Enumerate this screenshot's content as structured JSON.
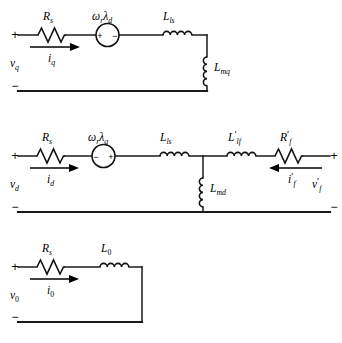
{
  "figure": {
    "type": "circuit-diagram",
    "ink_color": "#111111",
    "background_color": "#ffffff",
    "width": 342,
    "height": 343
  },
  "circuits": [
    {
      "id": "q-axis",
      "name": "q-axis equivalent circuit",
      "terminal": {
        "plus": "+",
        "minus": "−",
        "voltage_base": "v",
        "voltage_sub": "q"
      },
      "current": {
        "base": "i",
        "sub": "q"
      },
      "elements": [
        {
          "kind": "resistor",
          "base": "R",
          "sub": "s",
          "prime": ""
        },
        {
          "kind": "source",
          "base": "ω",
          "sub": "r",
          "base2": "λ",
          "sub2": "d",
          "polarity_left": "+",
          "polarity_right": "−"
        },
        {
          "kind": "inductor",
          "base": "L",
          "sub": "ls",
          "prime": ""
        },
        {
          "kind": "shunt-inductor",
          "base": "L",
          "sub": "mq",
          "prime": ""
        }
      ]
    },
    {
      "id": "d-axis",
      "name": "d-axis equivalent circuit",
      "terminal": {
        "plus": "+",
        "minus": "−",
        "voltage_base": "v",
        "voltage_sub": "d"
      },
      "current": {
        "base": "i",
        "sub": "d"
      },
      "terminal_right": {
        "plus": "+",
        "minus": "−",
        "voltage_base": "v",
        "voltage_sub": "f",
        "voltage_prime": "′"
      },
      "current_right": {
        "base": "i",
        "sub": "f",
        "prime": "′"
      },
      "elements": [
        {
          "kind": "resistor",
          "base": "R",
          "sub": "s",
          "prime": ""
        },
        {
          "kind": "source",
          "base": "ω",
          "sub": "r",
          "base2": "λ",
          "sub2": "q",
          "polarity_left": "−",
          "polarity_right": "+"
        },
        {
          "kind": "inductor",
          "base": "L",
          "sub": "ls",
          "prime": ""
        },
        {
          "kind": "shunt-inductor",
          "base": "L",
          "sub": "md",
          "prime": ""
        },
        {
          "kind": "inductor",
          "base": "L",
          "sub": "lf",
          "prime": "′"
        },
        {
          "kind": "resistor",
          "base": "R",
          "sub": "f",
          "prime": "′"
        }
      ]
    },
    {
      "id": "zero-sequence",
      "name": "zero-sequence equivalent circuit",
      "terminal": {
        "plus": "+",
        "minus": "−",
        "voltage_base": "v",
        "voltage_sub": "0"
      },
      "current": {
        "base": "i",
        "sub": "0"
      },
      "elements": [
        {
          "kind": "resistor",
          "base": "R",
          "sub": "s",
          "prime": ""
        },
        {
          "kind": "inductor",
          "base": "L",
          "sub": "0",
          "prime": ""
        }
      ]
    }
  ]
}
